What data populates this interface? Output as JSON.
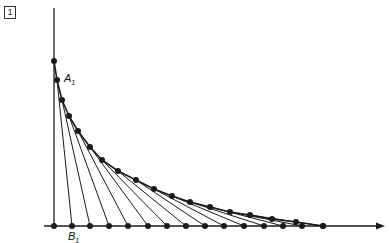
{
  "figure_number": "1",
  "labels": {
    "a": {
      "text": "A",
      "sub": "1"
    },
    "b": {
      "text": "B",
      "sub": "1"
    }
  },
  "colors": {
    "ink": "#1a1a1a"
  },
  "diagram": {
    "type": "line-envelope (curve stitching)",
    "axes": {
      "origin": [
        54,
        226
      ],
      "vertical_top": [
        54,
        8
      ],
      "horizontal_end": [
        385,
        226
      ]
    },
    "vertical_points": [
      [
        54,
        61
      ],
      [
        54,
        80
      ]
    ],
    "curve_points": [
      [
        54,
        61
      ],
      [
        57,
        80
      ],
      [
        62,
        100
      ],
      [
        69,
        116
      ],
      [
        78,
        131
      ],
      [
        90,
        147
      ],
      [
        102,
        160
      ],
      [
        118,
        171
      ],
      [
        136,
        180
      ],
      [
        154,
        189
      ],
      [
        172,
        196
      ],
      [
        190,
        202
      ],
      [
        210,
        207
      ],
      [
        230,
        212
      ],
      [
        250,
        215
      ],
      [
        272,
        219
      ],
      [
        296,
        222
      ],
      [
        323,
        226
      ]
    ],
    "baseline_points": [
      54,
      72,
      90,
      109,
      128,
      148,
      167,
      186,
      205,
      224,
      244,
      264,
      283,
      302,
      323
    ]
  }
}
